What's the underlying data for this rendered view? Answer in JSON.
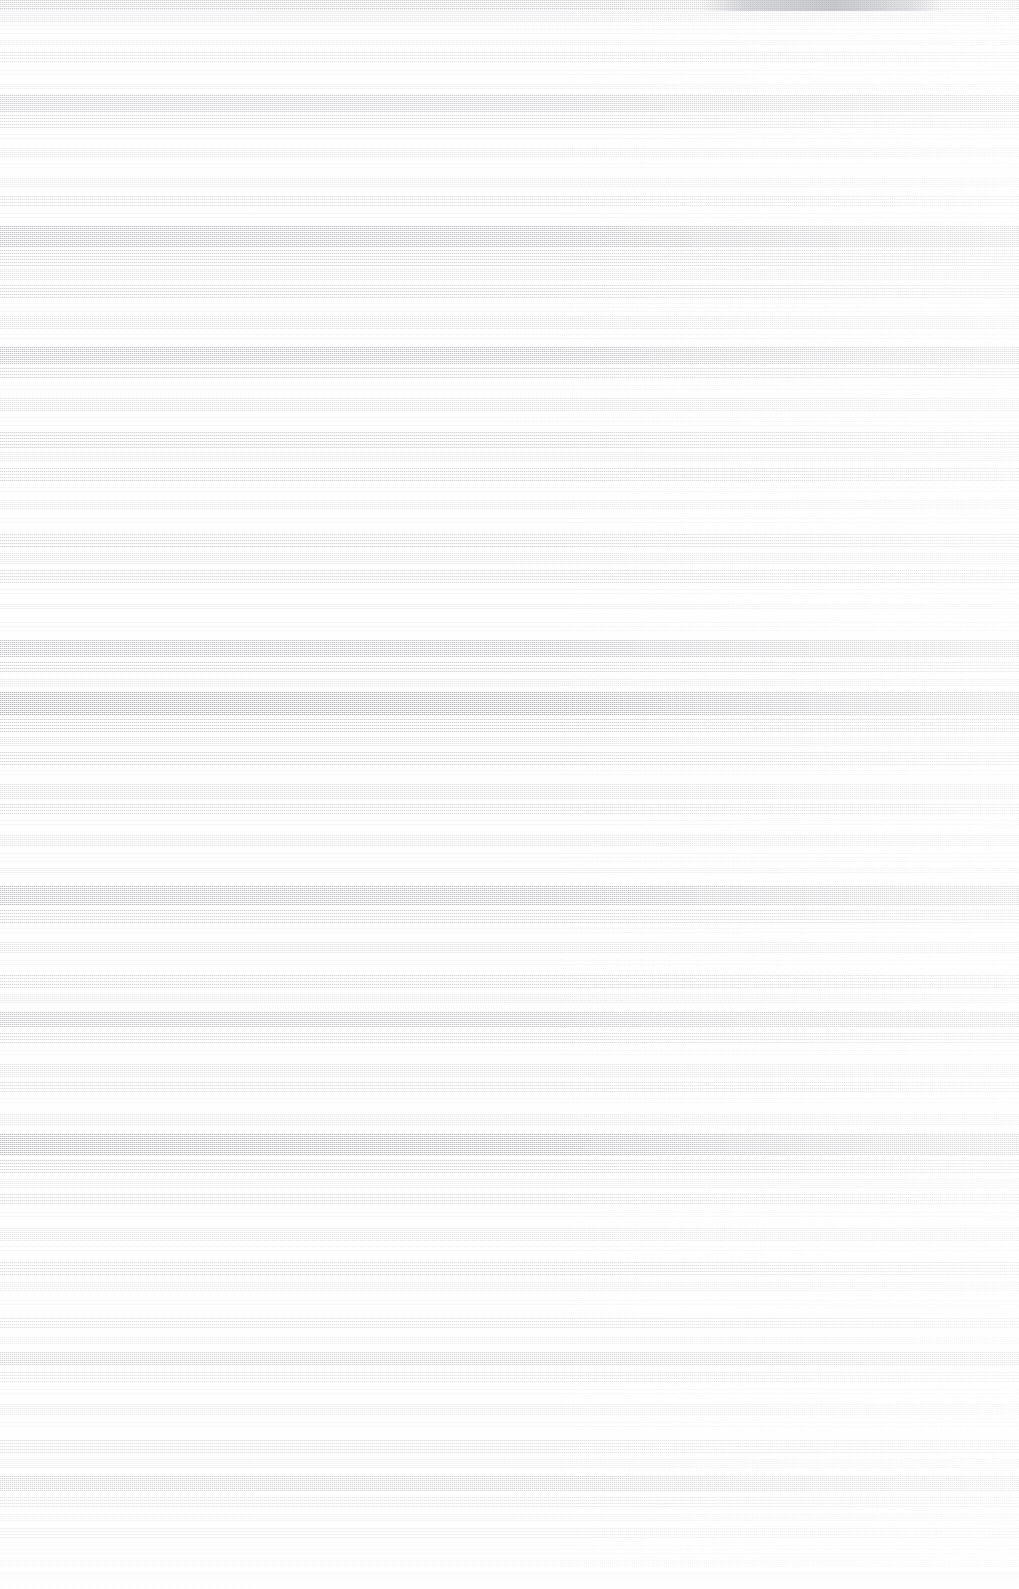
{
  "capture": {
    "width": 1019,
    "height": 1589,
    "background_color": "#fefefe",
    "condition": "degraded",
    "artifact_type": "horizontal-scanline-corruption",
    "legible_text_present": false,
    "description": "Screenshot is rendered entirely as horizontal raster streaks on a near-white page; no text, icons, or discrete UI controls are recoverable."
  },
  "palette": {
    "page": "#fefefe",
    "streak_light": "#f2f2f4",
    "streak_mid": "#dcdde1",
    "streak_dark": "#c6c8ce",
    "chrome_smudge": "#8a8c93",
    "footer_plate": "#f6f6f8"
  },
  "chrome": {
    "titlebar_smudge": {
      "x": 700,
      "width": 245,
      "height": 11
    },
    "footer_plate": {
      "y": 1572,
      "height": 17
    }
  },
  "bands": [
    {
      "y": 0,
      "h": 9,
      "texture": "solid",
      "opacity": 0.6
    },
    {
      "y": 9,
      "h": 14,
      "texture": "fine",
      "opacity": 0.52
    },
    {
      "y": 25,
      "h": 10,
      "texture": "sparse",
      "opacity": 0.34
    },
    {
      "y": 40,
      "h": 6,
      "texture": "fine",
      "opacity": 0.3
    },
    {
      "y": 52,
      "h": 12,
      "texture": "medium",
      "opacity": 0.4
    },
    {
      "y": 70,
      "h": 7,
      "texture": "sparse",
      "opacity": 0.26
    },
    {
      "y": 84,
      "h": 5,
      "texture": "fine",
      "opacity": 0.28
    },
    {
      "y": 95,
      "h": 18,
      "texture": "solid",
      "opacity": 0.55
    },
    {
      "y": 115,
      "h": 14,
      "texture": "medium",
      "opacity": 0.46
    },
    {
      "y": 134,
      "h": 8,
      "texture": "sparse",
      "opacity": 0.28
    },
    {
      "y": 148,
      "h": 10,
      "texture": "fine",
      "opacity": 0.34
    },
    {
      "y": 163,
      "h": 6,
      "texture": "sparse",
      "opacity": 0.22
    },
    {
      "y": 178,
      "h": 9,
      "texture": "fine",
      "opacity": 0.3
    },
    {
      "y": 196,
      "h": 12,
      "texture": "medium",
      "opacity": 0.38
    },
    {
      "y": 213,
      "h": 7,
      "texture": "sparse",
      "opacity": 0.24
    },
    {
      "y": 226,
      "h": 22,
      "texture": "solid",
      "opacity": 0.62
    },
    {
      "y": 250,
      "h": 16,
      "texture": "medium",
      "opacity": 0.5
    },
    {
      "y": 269,
      "h": 11,
      "texture": "fine",
      "opacity": 0.38
    },
    {
      "y": 285,
      "h": 14,
      "texture": "medium",
      "opacity": 0.44
    },
    {
      "y": 303,
      "h": 9,
      "texture": "sparse",
      "opacity": 0.28
    },
    {
      "y": 316,
      "h": 13,
      "texture": "fine",
      "opacity": 0.4
    },
    {
      "y": 334,
      "h": 8,
      "texture": "sparse",
      "opacity": 0.26
    },
    {
      "y": 347,
      "h": 17,
      "texture": "solid",
      "opacity": 0.56
    },
    {
      "y": 368,
      "h": 12,
      "texture": "medium",
      "opacity": 0.46
    },
    {
      "y": 385,
      "h": 6,
      "texture": "sparse",
      "opacity": 0.22
    },
    {
      "y": 398,
      "h": 14,
      "texture": "fine",
      "opacity": 0.42
    },
    {
      "y": 417,
      "h": 9,
      "texture": "sparse",
      "opacity": 0.26
    },
    {
      "y": 432,
      "h": 16,
      "texture": "medium",
      "opacity": 0.48
    },
    {
      "y": 452,
      "h": 10,
      "texture": "fine",
      "opacity": 0.34
    },
    {
      "y": 468,
      "h": 13,
      "texture": "medium",
      "opacity": 0.44
    },
    {
      "y": 487,
      "h": 7,
      "texture": "sparse",
      "opacity": 0.22
    },
    {
      "y": 500,
      "h": 9,
      "texture": "fine",
      "opacity": 0.28
    },
    {
      "y": 518,
      "h": 6,
      "texture": "sparse",
      "opacity": 0.2
    },
    {
      "y": 534,
      "h": 15,
      "texture": "medium",
      "opacity": 0.42
    },
    {
      "y": 553,
      "h": 11,
      "texture": "fine",
      "opacity": 0.34
    },
    {
      "y": 570,
      "h": 13,
      "texture": "medium",
      "opacity": 0.4
    },
    {
      "y": 589,
      "h": 7,
      "texture": "sparse",
      "opacity": 0.22
    },
    {
      "y": 604,
      "h": 5,
      "texture": "fine",
      "opacity": 0.22
    },
    {
      "y": 622,
      "h": 9,
      "texture": "sparse",
      "opacity": 0.24
    },
    {
      "y": 640,
      "h": 18,
      "texture": "solid",
      "opacity": 0.52
    },
    {
      "y": 662,
      "h": 12,
      "texture": "medium",
      "opacity": 0.44
    },
    {
      "y": 679,
      "h": 8,
      "texture": "fine",
      "opacity": 0.3
    },
    {
      "y": 692,
      "h": 24,
      "texture": "solid",
      "opacity": 0.66
    },
    {
      "y": 719,
      "h": 14,
      "texture": "medium",
      "opacity": 0.5
    },
    {
      "y": 737,
      "h": 10,
      "texture": "fine",
      "opacity": 0.36
    },
    {
      "y": 752,
      "h": 13,
      "texture": "medium",
      "opacity": 0.42
    },
    {
      "y": 770,
      "h": 8,
      "texture": "sparse",
      "opacity": 0.26
    },
    {
      "y": 784,
      "h": 15,
      "texture": "fine",
      "opacity": 0.42
    },
    {
      "y": 804,
      "h": 11,
      "texture": "medium",
      "opacity": 0.38
    },
    {
      "y": 820,
      "h": 7,
      "texture": "sparse",
      "opacity": 0.24
    },
    {
      "y": 835,
      "h": 12,
      "texture": "fine",
      "opacity": 0.36
    },
    {
      "y": 853,
      "h": 9,
      "texture": "sparse",
      "opacity": 0.26
    },
    {
      "y": 868,
      "h": 6,
      "texture": "fine",
      "opacity": 0.24
    },
    {
      "y": 886,
      "h": 20,
      "texture": "solid",
      "opacity": 0.58
    },
    {
      "y": 910,
      "h": 13,
      "texture": "medium",
      "opacity": 0.44
    },
    {
      "y": 928,
      "h": 8,
      "texture": "sparse",
      "opacity": 0.26
    },
    {
      "y": 942,
      "h": 11,
      "texture": "fine",
      "opacity": 0.34
    },
    {
      "y": 960,
      "h": 7,
      "texture": "sparse",
      "opacity": 0.22
    },
    {
      "y": 975,
      "h": 14,
      "texture": "medium",
      "opacity": 0.44
    },
    {
      "y": 994,
      "h": 9,
      "texture": "fine",
      "opacity": 0.3
    },
    {
      "y": 1012,
      "h": 16,
      "texture": "solid",
      "opacity": 0.5
    },
    {
      "y": 1033,
      "h": 12,
      "texture": "medium",
      "opacity": 0.42
    },
    {
      "y": 1050,
      "h": 8,
      "texture": "sparse",
      "opacity": 0.26
    },
    {
      "y": 1064,
      "h": 13,
      "texture": "fine",
      "opacity": 0.38
    },
    {
      "y": 1082,
      "h": 10,
      "texture": "medium",
      "opacity": 0.36
    },
    {
      "y": 1098,
      "h": 7,
      "texture": "sparse",
      "opacity": 0.22
    },
    {
      "y": 1114,
      "h": 11,
      "texture": "fine",
      "opacity": 0.34
    },
    {
      "y": 1134,
      "h": 22,
      "texture": "solid",
      "opacity": 0.64
    },
    {
      "y": 1160,
      "h": 14,
      "texture": "medium",
      "opacity": 0.48
    },
    {
      "y": 1179,
      "h": 9,
      "texture": "fine",
      "opacity": 0.3
    },
    {
      "y": 1194,
      "h": 12,
      "texture": "medium",
      "opacity": 0.4
    },
    {
      "y": 1212,
      "h": 7,
      "texture": "sparse",
      "opacity": 0.24
    },
    {
      "y": 1228,
      "h": 13,
      "texture": "fine",
      "opacity": 0.38
    },
    {
      "y": 1246,
      "h": 8,
      "texture": "sparse",
      "opacity": 0.24
    },
    {
      "y": 1262,
      "h": 15,
      "texture": "medium",
      "opacity": 0.44
    },
    {
      "y": 1282,
      "h": 9,
      "texture": "fine",
      "opacity": 0.3
    },
    {
      "y": 1300,
      "h": 6,
      "texture": "sparse",
      "opacity": 0.2
    },
    {
      "y": 1318,
      "h": 12,
      "texture": "medium",
      "opacity": 0.38
    },
    {
      "y": 1337,
      "h": 8,
      "texture": "fine",
      "opacity": 0.28
    },
    {
      "y": 1352,
      "h": 14,
      "texture": "solid",
      "opacity": 0.46
    },
    {
      "y": 1372,
      "h": 10,
      "texture": "medium",
      "opacity": 0.36
    },
    {
      "y": 1389,
      "h": 7,
      "texture": "sparse",
      "opacity": 0.22
    },
    {
      "y": 1404,
      "h": 11,
      "texture": "fine",
      "opacity": 0.32
    },
    {
      "y": 1422,
      "h": 8,
      "texture": "sparse",
      "opacity": 0.24
    },
    {
      "y": 1440,
      "h": 13,
      "texture": "medium",
      "opacity": 0.4
    },
    {
      "y": 1459,
      "h": 9,
      "texture": "fine",
      "opacity": 0.3
    },
    {
      "y": 1476,
      "h": 16,
      "texture": "solid",
      "opacity": 0.5
    },
    {
      "y": 1497,
      "h": 12,
      "texture": "medium",
      "opacity": 0.42
    },
    {
      "y": 1514,
      "h": 8,
      "texture": "fine",
      "opacity": 0.28
    },
    {
      "y": 1528,
      "h": 11,
      "texture": "medium",
      "opacity": 0.34
    },
    {
      "y": 1545,
      "h": 9,
      "texture": "sparse",
      "opacity": 0.24
    },
    {
      "y": 1560,
      "h": 8,
      "texture": "fine",
      "opacity": 0.26
    }
  ]
}
